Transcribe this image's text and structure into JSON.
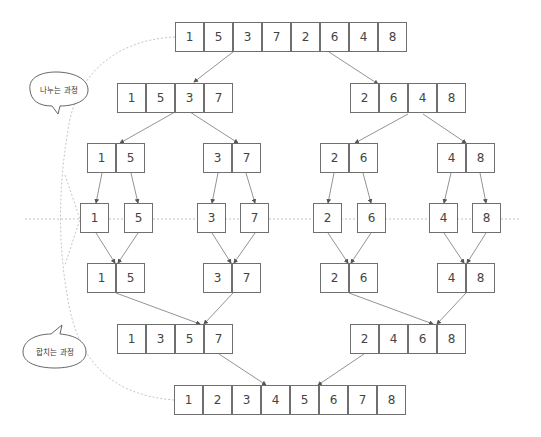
{
  "labels": {
    "divide": "나누는 과정",
    "merge": "합치는 과정"
  },
  "levels": [
    {
      "name": "divide-level-0",
      "y": 22,
      "groups": [
        {
          "x": 175,
          "values": [
            1,
            5,
            3,
            7,
            2,
            6,
            4,
            8
          ]
        }
      ]
    },
    {
      "name": "divide-level-1",
      "y": 83,
      "groups": [
        {
          "x": 117,
          "values": [
            1,
            5,
            3,
            7
          ]
        },
        {
          "x": 350,
          "values": [
            2,
            6,
            4,
            8
          ]
        }
      ]
    },
    {
      "name": "divide-level-2",
      "y": 143,
      "groups": [
        {
          "x": 87,
          "values": [
            1,
            5
          ]
        },
        {
          "x": 203,
          "values": [
            3,
            7
          ]
        },
        {
          "x": 320,
          "values": [
            2,
            6
          ]
        },
        {
          "x": 437,
          "values": [
            4,
            8
          ]
        }
      ]
    },
    {
      "name": "single-level",
      "y": 203,
      "groups": [
        {
          "x": 80,
          "values": [
            1
          ]
        },
        {
          "x": 124,
          "values": [
            5
          ]
        },
        {
          "x": 197,
          "values": [
            3
          ]
        },
        {
          "x": 240,
          "values": [
            7
          ]
        },
        {
          "x": 313,
          "values": [
            2
          ]
        },
        {
          "x": 357,
          "values": [
            6
          ]
        },
        {
          "x": 429,
          "values": [
            4
          ]
        },
        {
          "x": 472,
          "values": [
            8
          ]
        }
      ]
    },
    {
      "name": "merge-level-1",
      "y": 263,
      "groups": [
        {
          "x": 87,
          "values": [
            1,
            5
          ]
        },
        {
          "x": 203,
          "values": [
            3,
            7
          ]
        },
        {
          "x": 320,
          "values": [
            2,
            6
          ]
        },
        {
          "x": 437,
          "values": [
            4,
            8
          ]
        }
      ]
    },
    {
      "name": "merge-level-2",
      "y": 324,
      "groups": [
        {
          "x": 117,
          "values": [
            1,
            3,
            5,
            7
          ]
        },
        {
          "x": 350,
          "values": [
            2,
            4,
            6,
            8
          ]
        }
      ]
    },
    {
      "name": "merge-level-3",
      "y": 385,
      "groups": [
        {
          "x": 174,
          "values": [
            1,
            2,
            3,
            4,
            5,
            6,
            7,
            8
          ]
        }
      ]
    }
  ],
  "arrows": [
    [
      233,
      52,
      194,
      82
    ],
    [
      329,
      52,
      378,
      84
    ],
    [
      175,
      112,
      120,
      143
    ],
    [
      190,
      112,
      238,
      143
    ],
    [
      408,
      114,
      355,
      143
    ],
    [
      423,
      114,
      466,
      143
    ],
    [
      102,
      173,
      96,
      203
    ],
    [
      131,
      173,
      138,
      203
    ],
    [
      218,
      173,
      212,
      203
    ],
    [
      246,
      173,
      255,
      203
    ],
    [
      334,
      173,
      328,
      203
    ],
    [
      363,
      173,
      371,
      203
    ],
    [
      451,
      173,
      444,
      203
    ],
    [
      480,
      173,
      486,
      203
    ],
    [
      96,
      233,
      115,
      263
    ],
    [
      138,
      233,
      118,
      263
    ],
    [
      212,
      233,
      231,
      263
    ],
    [
      255,
      233,
      234,
      263
    ],
    [
      328,
      233,
      348,
      263
    ],
    [
      371,
      233,
      351,
      263
    ],
    [
      444,
      233,
      464,
      263
    ],
    [
      486,
      233,
      467,
      263
    ],
    [
      116,
      293,
      200,
      324
    ],
    [
      233,
      293,
      204,
      324
    ],
    [
      349,
      293,
      433,
      324
    ],
    [
      466,
      293,
      437,
      324
    ],
    [
      219,
      354,
      266,
      385
    ],
    [
      364,
      354,
      318,
      385
    ]
  ],
  "colors": {
    "border": "#6f6f6f",
    "arrow": "#777777",
    "dashed": "#aaaaaa",
    "text": "#444444"
  }
}
